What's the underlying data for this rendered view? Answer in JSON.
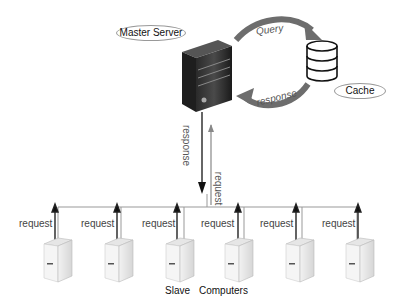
{
  "diagram": {
    "master": {
      "label": "Master Server"
    },
    "cache": {
      "label": "Cache"
    },
    "arrows": {
      "query": "Query",
      "cache_response": "response",
      "master_to_slaves": "response",
      "slaves_to_master": "request"
    },
    "slaves": {
      "caption_left": "Slave",
      "caption_right": "Computers",
      "items": [
        {
          "request_label": "request"
        },
        {
          "request_label": "request"
        },
        {
          "request_label": "request"
        },
        {
          "request_label": "request"
        },
        {
          "request_label": "request"
        },
        {
          "request_label": "request"
        }
      ]
    }
  }
}
